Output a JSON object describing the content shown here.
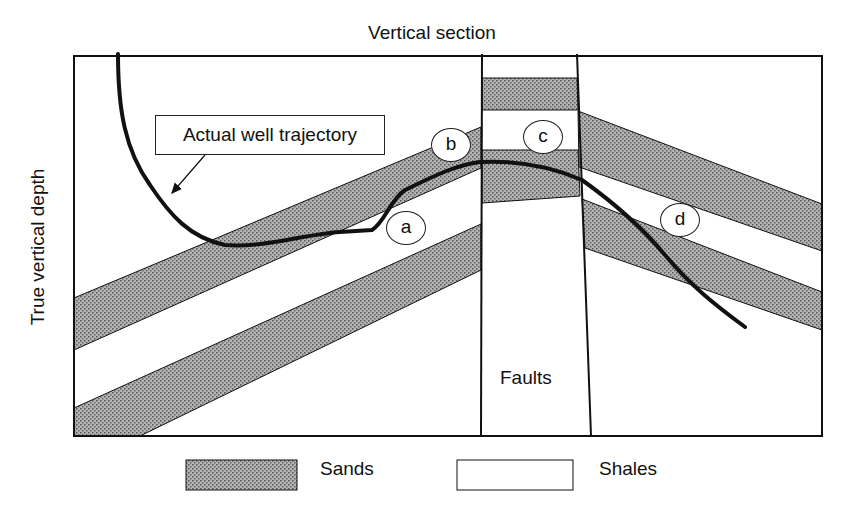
{
  "title": "Vertical section",
  "y_axis_label": "True vertical depth",
  "callout": "Actual well trajectory",
  "zone_labels": [
    "a",
    "b",
    "c",
    "d"
  ],
  "fault_label": "Faults",
  "legend": [
    {
      "label": "Sands",
      "pattern": "stippled-gray",
      "color": "#9a9a9a"
    },
    {
      "label": "Shales",
      "pattern": "white",
      "color": "#ffffff"
    }
  ],
  "colors": {
    "line": "#111111",
    "sand_fill": "#a8a8a8",
    "shale_fill": "#ffffff"
  }
}
